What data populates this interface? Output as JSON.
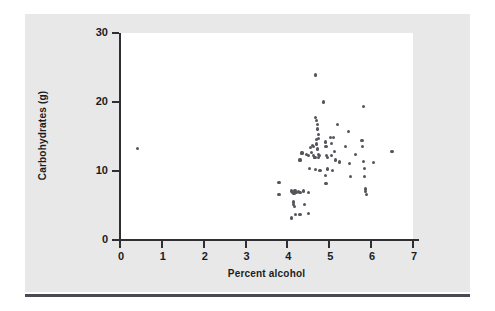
{
  "figure": {
    "panel_color": "#e8e8e8",
    "plot_bg_color": "#ffffff",
    "axis_color": "#2f2f33",
    "point_color": "#55555c",
    "rule_color": "#4a4a52"
  },
  "chart_data": {
    "type": "scatter",
    "title": "",
    "xlabel": "Percent alcohol",
    "ylabel": "Carbohydrates (g)",
    "xlim": [
      0,
      7
    ],
    "ylim": [
      0,
      30
    ],
    "xticks": [
      0,
      1,
      2,
      3,
      4,
      5,
      6,
      7
    ],
    "xtick_labels": [
      "0",
      "1",
      "2",
      "3",
      "4",
      "5",
      "6",
      "7"
    ],
    "yticks": [
      0,
      10,
      20,
      30
    ],
    "ytick_labels": [
      "0",
      "10",
      "20",
      "30"
    ],
    "grid": false,
    "legend": null,
    "marker": "filled-circle",
    "points": [
      {
        "x": 0.42,
        "y": 13.3
      },
      {
        "x": 3.8,
        "y": 8.3
      },
      {
        "x": 3.8,
        "y": 6.6
      },
      {
        "x": 4.1,
        "y": 7.2
      },
      {
        "x": 4.1,
        "y": 7.0
      },
      {
        "x": 4.12,
        "y": 6.9
      },
      {
        "x": 4.14,
        "y": 6.8
      },
      {
        "x": 4.16,
        "y": 6.7
      },
      {
        "x": 4.18,
        "y": 7.1
      },
      {
        "x": 4.22,
        "y": 6.9
      },
      {
        "x": 4.26,
        "y": 7.0
      },
      {
        "x": 4.3,
        "y": 6.9
      },
      {
        "x": 4.38,
        "y": 7.1
      },
      {
        "x": 4.5,
        "y": 6.9
      },
      {
        "x": 4.15,
        "y": 5.5
      },
      {
        "x": 4.15,
        "y": 5.2
      },
      {
        "x": 4.16,
        "y": 4.9
      },
      {
        "x": 4.4,
        "y": 5.2
      },
      {
        "x": 4.1,
        "y": 3.2
      },
      {
        "x": 4.2,
        "y": 3.7
      },
      {
        "x": 4.3,
        "y": 3.7
      },
      {
        "x": 4.5,
        "y": 3.8
      },
      {
        "x": 4.3,
        "y": 11.6
      },
      {
        "x": 4.35,
        "y": 12.6
      },
      {
        "x": 4.45,
        "y": 12.4
      },
      {
        "x": 4.5,
        "y": 12.2
      },
      {
        "x": 4.52,
        "y": 10.4
      },
      {
        "x": 4.55,
        "y": 13.4
      },
      {
        "x": 4.58,
        "y": 12.7
      },
      {
        "x": 4.6,
        "y": 13.7
      },
      {
        "x": 4.62,
        "y": 13.5
      },
      {
        "x": 4.62,
        "y": 12.3
      },
      {
        "x": 4.64,
        "y": 12.0
      },
      {
        "x": 4.66,
        "y": 11.9
      },
      {
        "x": 4.68,
        "y": 10.2
      },
      {
        "x": 4.7,
        "y": 14.6
      },
      {
        "x": 4.7,
        "y": 13.9
      },
      {
        "x": 4.72,
        "y": 13.2
      },
      {
        "x": 4.74,
        "y": 12.4
      },
      {
        "x": 4.74,
        "y": 11.9
      },
      {
        "x": 4.76,
        "y": 12.2
      },
      {
        "x": 4.78,
        "y": 10.1
      },
      {
        "x": 4.68,
        "y": 17.8
      },
      {
        "x": 4.7,
        "y": 17.3
      },
      {
        "x": 4.72,
        "y": 16.7
      },
      {
        "x": 4.72,
        "y": 16.1
      },
      {
        "x": 4.74,
        "y": 15.3
      },
      {
        "x": 4.74,
        "y": 14.7
      },
      {
        "x": 4.68,
        "y": 23.9
      },
      {
        "x": 4.86,
        "y": 20.0
      },
      {
        "x": 4.9,
        "y": 14.2
      },
      {
        "x": 4.92,
        "y": 13.6
      },
      {
        "x": 4.94,
        "y": 12.3
      },
      {
        "x": 4.96,
        "y": 11.9
      },
      {
        "x": 4.96,
        "y": 10.3
      },
      {
        "x": 4.9,
        "y": 9.3
      },
      {
        "x": 4.92,
        "y": 8.2
      },
      {
        "x": 5.02,
        "y": 14.8
      },
      {
        "x": 5.05,
        "y": 14.0
      },
      {
        "x": 5.05,
        "y": 12.2
      },
      {
        "x": 5.08,
        "y": 10.1
      },
      {
        "x": 5.1,
        "y": 14.8
      },
      {
        "x": 5.12,
        "y": 12.8
      },
      {
        "x": 5.14,
        "y": 11.6
      },
      {
        "x": 5.2,
        "y": 16.7
      },
      {
        "x": 5.25,
        "y": 11.3
      },
      {
        "x": 5.38,
        "y": 13.6
      },
      {
        "x": 5.45,
        "y": 15.7
      },
      {
        "x": 5.48,
        "y": 11.1
      },
      {
        "x": 5.5,
        "y": 9.2
      },
      {
        "x": 5.62,
        "y": 12.4
      },
      {
        "x": 5.82,
        "y": 19.4
      },
      {
        "x": 5.78,
        "y": 14.4
      },
      {
        "x": 5.8,
        "y": 13.6
      },
      {
        "x": 5.82,
        "y": 11.4
      },
      {
        "x": 5.84,
        "y": 10.4
      },
      {
        "x": 5.84,
        "y": 9.2
      },
      {
        "x": 5.86,
        "y": 7.4
      },
      {
        "x": 5.86,
        "y": 7.0
      },
      {
        "x": 5.88,
        "y": 6.6
      },
      {
        "x": 6.05,
        "y": 11.2
      },
      {
        "x": 6.5,
        "y": 12.8
      }
    ]
  }
}
